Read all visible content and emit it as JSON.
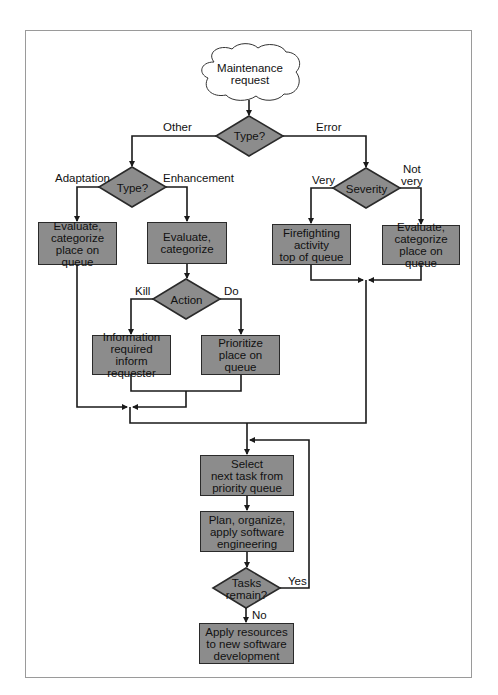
{
  "diagram": {
    "type": "flowchart",
    "start": {
      "id": "maintenance-request",
      "label": "Maintenance\nrequest",
      "shape": "cloud"
    },
    "decisions": {
      "type_top": {
        "label": "Type?"
      },
      "type_other": {
        "label": "Type?"
      },
      "severity": {
        "label": "Severity"
      },
      "action": {
        "label": "Action"
      },
      "tasks_remain": {
        "label": "Tasks\nremain?"
      }
    },
    "processes": {
      "adaptation_eval": {
        "label": "Evaluate,\ncategorize\nplace on queue"
      },
      "enhancement_eval": {
        "label": "Evaluate,\ncategorize"
      },
      "firefighting": {
        "label": "Firefighting\nactivity\ntop of queue"
      },
      "notvery_eval": {
        "label": "Evaluate,\ncategorize\nplace on queue"
      },
      "info_required": {
        "label": "Information\nrequired\ninform requester"
      },
      "prioritize": {
        "label": "Prioritize\nplace on queue"
      },
      "select_next": {
        "label": "Select\nnext task from\npriority queue"
      },
      "plan": {
        "label": "Plan, organize,\napply software\nengineering"
      },
      "apply_resources": {
        "label": "Apply resources\nto new software\ndevelopment"
      }
    },
    "edge_labels": {
      "other": "Other",
      "error": "Error",
      "adaptation": "Adaptation",
      "enhancement": "Enhancement",
      "very": "Very",
      "not_very": "Not\nvery",
      "kill": "Kill",
      "do": "Do",
      "yes": "Yes",
      "no": "No"
    },
    "colors": {
      "node_fill": "#8c8c8c",
      "node_border": "#2a2a2a",
      "line": "#1a1a1a",
      "frame": "#9a9a9a"
    }
  }
}
